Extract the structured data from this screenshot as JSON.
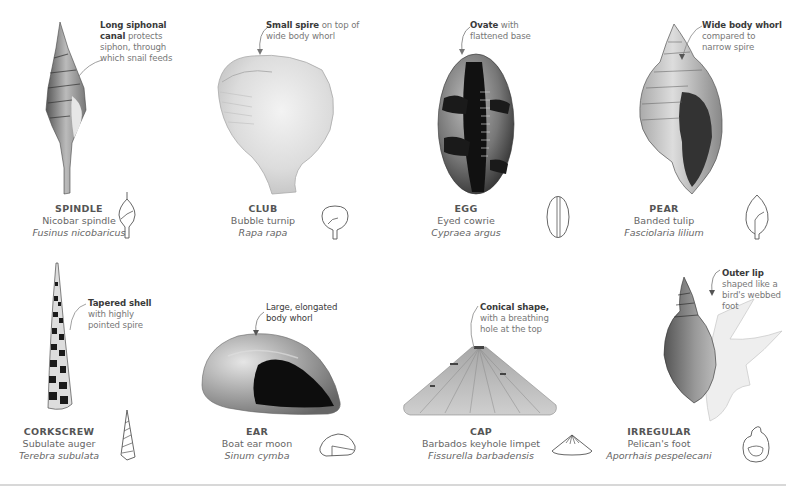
{
  "shells": [
    {
      "id": "spindle",
      "type": "SPINDLE",
      "common_name": "Nicobar spindle",
      "latin_name": "Fusinus nicobaricus",
      "annotation_bold": "Long siphonal canal",
      "annotation_rest": " protects siphon, through which snail feeds",
      "glyph": "spindle-outline-icon"
    },
    {
      "id": "club",
      "type": "CLUB",
      "common_name": "Bubble turnip",
      "latin_name": "Rapa rapa",
      "annotation_bold": "Small spire",
      "annotation_rest": " on top of wide body whorl",
      "glyph": "club-outline-icon"
    },
    {
      "id": "egg",
      "type": "EGG",
      "common_name": "Eyed cowrie",
      "latin_name": "Cypraea argus",
      "annotation_bold": "Ovate",
      "annotation_rest": " with flattened base",
      "glyph": "egg-outline-icon"
    },
    {
      "id": "pear",
      "type": "PEAR",
      "common_name": "Banded tulip",
      "latin_name": "Fasciolaria lilium",
      "annotation_bold": "Wide body whorl",
      "annotation_rest": " compared to narrow spire",
      "glyph": "pear-outline-icon"
    },
    {
      "id": "corkscrew",
      "type": "CORKSCREW",
      "common_name": "Subulate auger",
      "latin_name": "Terebra subulata",
      "annotation_bold": "Tapered shell",
      "annotation_rest": " with highly pointed spire",
      "glyph": "corkscrew-outline-icon"
    },
    {
      "id": "ear",
      "type": "EAR",
      "common_name": "Boat ear moon",
      "latin_name": "Sinum cymba",
      "annotation_bold": "Large, elongated body whorl",
      "annotation_rest": "",
      "glyph": "ear-outline-icon"
    },
    {
      "id": "cap",
      "type": "CAP",
      "common_name": "Barbados keyhole limpet",
      "latin_name": "Fissurella barbadensis",
      "annotation_bold": "Conical shape,",
      "annotation_rest": " with a breathing hole at the top",
      "glyph": "cap-outline-icon"
    },
    {
      "id": "irregular",
      "type": "IRREGULAR",
      "common_name": "Pelican's foot",
      "latin_name": "Aporrhais pespelecani",
      "annotation_bold": "Outer lip",
      "annotation_rest": " shaped like a bird's webbed foot",
      "glyph": "irregular-outline-icon"
    }
  ],
  "colors": {
    "background": "#ffffff",
    "text_bold": "#3a3a3a",
    "text_regular": "#666666",
    "rule": "#d8d8d8"
  }
}
